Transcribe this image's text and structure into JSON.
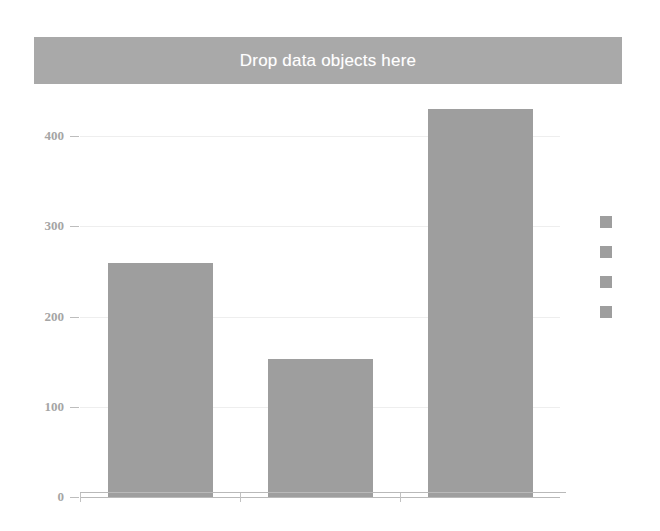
{
  "drop_zone": {
    "label": "Drop data objects here",
    "background_color": "#a9a9a9",
    "text_color": "#ffffff"
  },
  "legend": {
    "position": "right",
    "swatch_color": "#9e9e9e",
    "items": [
      {
        "label": "",
        "color": "#9e9e9e"
      },
      {
        "label": "",
        "color": "#9e9e9e"
      },
      {
        "label": "",
        "color": "#9e9e9e"
      },
      {
        "label": "",
        "color": "#9e9e9e"
      }
    ]
  },
  "chart_data": {
    "type": "bar",
    "title": "",
    "xlabel": "",
    "ylabel": "",
    "categories": [
      "",
      "",
      ""
    ],
    "values": [
      259,
      153,
      430
    ],
    "ylim": [
      0,
      440
    ],
    "yticks": [
      0,
      100,
      200,
      300,
      400
    ],
    "ytick_labels": [
      "0",
      "100",
      "200",
      "300",
      "400"
    ],
    "xtick_labels": [
      "",
      "",
      ""
    ],
    "grid": true,
    "bar_color": "#9e9e9e",
    "axis_color": "#b9b9b9",
    "tick_label_color": "#a5a5a5",
    "background": "#ffffff"
  }
}
